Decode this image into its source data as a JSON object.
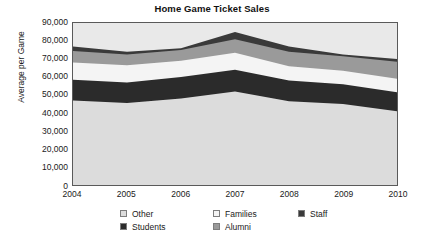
{
  "chart_data": {
    "type": "area",
    "stacked": true,
    "title": "Home Game Ticket Sales",
    "xlabel": "",
    "ylabel": "Average per Game",
    "categories": [
      "2004",
      "2005",
      "2006",
      "2007",
      "2008",
      "2009",
      "2010"
    ],
    "x": [
      2004,
      2005,
      2006,
      2007,
      2008,
      2009,
      2010
    ],
    "ylim": [
      0,
      90000
    ],
    "yticks": [
      0,
      10000,
      20000,
      30000,
      40000,
      50000,
      60000,
      70000,
      80000,
      90000
    ],
    "ytick_labels": [
      "0",
      "10,000",
      "20,000",
      "30,000",
      "40,000",
      "50,000",
      "60,000",
      "70,000",
      "80,000",
      "90,000"
    ],
    "grid": false,
    "legend_position": "bottom",
    "stack_order_bottom_to_top": [
      "Other",
      "Students",
      "Families",
      "Alumni",
      "Staff"
    ],
    "series": [
      {
        "name": "Other",
        "color": "#dcdcdc",
        "values": [
          47000,
          45500,
          48000,
          52000,
          46500,
          45000,
          41000
        ],
        "cumulative_top": [
          47000,
          45500,
          48000,
          52000,
          46500,
          45000,
          41000
        ]
      },
      {
        "name": "Students",
        "color": "#2b2b2b",
        "values": [
          11500,
          11500,
          12000,
          12000,
          11500,
          11000,
          10500
        ],
        "cumulative_top": [
          58500,
          57000,
          60000,
          64000,
          58000,
          56000,
          51500
        ]
      },
      {
        "name": "Families",
        "color": "#f4f4f4",
        "values": [
          9500,
          9500,
          9000,
          9500,
          8000,
          7500,
          7500
        ],
        "cumulative_top": [
          68000,
          66500,
          69000,
          73500,
          66000,
          63500,
          59000
        ]
      },
      {
        "name": "Alumni",
        "color": "#9a9a9a",
        "values": [
          6500,
          6000,
          6000,
          7500,
          8000,
          8000,
          9500
        ],
        "cumulative_top": [
          74500,
          72500,
          75000,
          81000,
          74000,
          71500,
          68500
        ]
      },
      {
        "name": "Staff",
        "color": "#3a3a3a",
        "values": [
          2500,
          1500,
          1000,
          4000,
          3000,
          1000,
          1500
        ],
        "cumulative_top": [
          77000,
          74000,
          76000,
          85000,
          77000,
          72500,
          70000
        ]
      }
    ],
    "totals": [
      77000,
      74000,
      76000,
      85000,
      77000,
      72500,
      70000
    ]
  },
  "legend": {
    "items": [
      {
        "label": "Other",
        "color": "#dcdcdc"
      },
      {
        "label": "Families",
        "color": "#f4f4f4"
      },
      {
        "label": "Staff",
        "color": "#3a3a3a"
      },
      {
        "label": "Students",
        "color": "#2b2b2b"
      },
      {
        "label": "Alumni",
        "color": "#9a9a9a"
      }
    ]
  },
  "plot": {
    "background": "#e9e9e9",
    "border_color": "#5a5a5a"
  }
}
